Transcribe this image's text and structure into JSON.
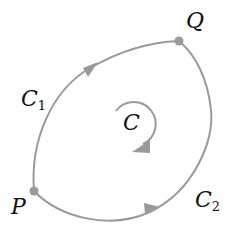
{
  "diagram": {
    "colors": {
      "curve": "#9a9a9a",
      "point": "#9a9a9a",
      "text": "#111111"
    },
    "points": [
      {
        "id": "P",
        "label": "P"
      },
      {
        "id": "Q",
        "label": "Q"
      }
    ],
    "curves": [
      {
        "id": "C1",
        "label": "C",
        "subscript": "1",
        "from": "P",
        "to": "Q"
      },
      {
        "id": "C2",
        "label": "C",
        "subscript": "2",
        "from": "P",
        "to": "Q"
      }
    ],
    "loop": {
      "label": "C",
      "direction": "clockwise"
    }
  }
}
